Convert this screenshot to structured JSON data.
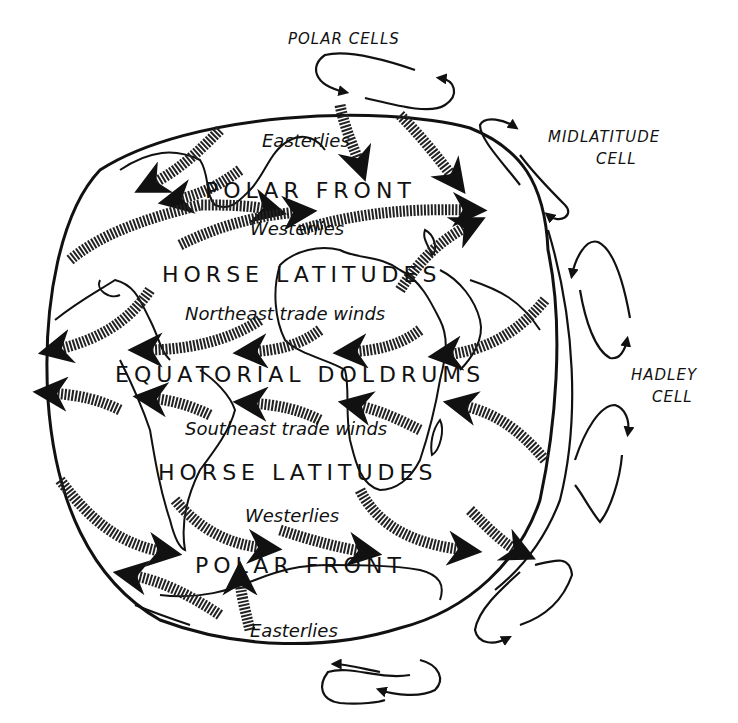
{
  "diagram": {
    "type": "global atmospheric circulation",
    "cells": [
      {
        "label": "POLAR CELLS",
        "position": "top"
      },
      {
        "label": "MIDLATITUDE CELL",
        "position": "upper-right"
      },
      {
        "label": "HADLEY CELL",
        "position": "right"
      }
    ],
    "bands": [
      "POLAR FRONT",
      "HORSE LATITUDES",
      "EQUATORIAL DOLDRUMS",
      "HORSE LATITUDES",
      "POLAR FRONT"
    ],
    "winds": [
      "Easterlies",
      "Westerlies",
      "Northeast trade winds",
      "Southeast trade winds",
      "Westerlies",
      "Easterlies"
    ]
  },
  "labels": {
    "polar_cells": "POLAR CELLS",
    "midlatitude_1": "MIDLATITUDE",
    "midlatitude_2": "CELL",
    "hadley_1": "HADLEY",
    "hadley_2": "CELL",
    "easterlies_n": "Easterlies",
    "polar_front_n": "POLAR FRONT",
    "westerlies_n": "Westerlies",
    "horse_lat_n": "HORSE LATITUDES",
    "ne_trades": "Northeast trade winds",
    "doldrums": "EQUATORIAL DOLDRUMS",
    "se_trades": "Southeast trade winds",
    "horse_lat_s": "HORSE LATITUDES",
    "westerlies_s": "Westerlies",
    "polar_front_s": "POLAR FRONT",
    "easterlies_s": "Easterlies"
  },
  "colors": {
    "ink": "#111111",
    "background": "#ffffff",
    "hatch": "#555555"
  }
}
